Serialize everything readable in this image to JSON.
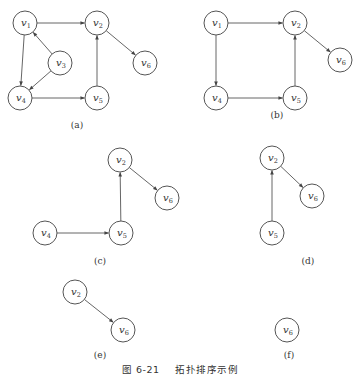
{
  "figure": {
    "caption_number": "图 6-21",
    "caption_title": "拓扑排序示例",
    "node_radius": 12,
    "colors": {
      "stroke": "#555555",
      "text": "#333333",
      "background": "#ffffff"
    },
    "panels": [
      {
        "id": "a",
        "label": "(a)",
        "label_pos": [
          77,
          128
        ],
        "nodes": [
          {
            "id": "v1",
            "name": "v",
            "sub": "1",
            "x": 25,
            "y": 23
          },
          {
            "id": "v2",
            "name": "v",
            "sub": "2",
            "x": 97,
            "y": 23
          },
          {
            "id": "v3",
            "name": "v",
            "sub": "3",
            "x": 60,
            "y": 63
          },
          {
            "id": "v4",
            "name": "v",
            "sub": "4",
            "x": 20,
            "y": 98
          },
          {
            "id": "v5",
            "name": "v",
            "sub": "5",
            "x": 97,
            "y": 98
          },
          {
            "id": "v6",
            "name": "v",
            "sub": "6",
            "x": 145,
            "y": 63
          }
        ],
        "edges": [
          [
            "v1",
            "v2"
          ],
          [
            "v1",
            "v4"
          ],
          [
            "v3",
            "v1"
          ],
          [
            "v3",
            "v4"
          ],
          [
            "v4",
            "v5"
          ],
          [
            "v5",
            "v2"
          ],
          [
            "v2",
            "v6"
          ]
        ]
      },
      {
        "id": "b",
        "label": "(b)",
        "label_pos": [
          277,
          118
        ],
        "nodes": [
          {
            "id": "v1",
            "name": "v",
            "sub": "1",
            "x": 216,
            "y": 23
          },
          {
            "id": "v2",
            "name": "v",
            "sub": "2",
            "x": 295,
            "y": 23
          },
          {
            "id": "v4",
            "name": "v",
            "sub": "4",
            "x": 216,
            "y": 98
          },
          {
            "id": "v5",
            "name": "v",
            "sub": "5",
            "x": 295,
            "y": 98
          },
          {
            "id": "v6",
            "name": "v",
            "sub": "6",
            "x": 340,
            "y": 60
          }
        ],
        "edges": [
          [
            "v1",
            "v2"
          ],
          [
            "v1",
            "v4"
          ],
          [
            "v4",
            "v5"
          ],
          [
            "v5",
            "v2"
          ],
          [
            "v2",
            "v6"
          ]
        ]
      },
      {
        "id": "c",
        "label": "(c)",
        "label_pos": [
          100,
          264
        ],
        "nodes": [
          {
            "id": "v2",
            "name": "v",
            "sub": "2",
            "x": 120,
            "y": 160
          },
          {
            "id": "v6",
            "name": "v",
            "sub": "6",
            "x": 167,
            "y": 198
          },
          {
            "id": "v4",
            "name": "v",
            "sub": "4",
            "x": 45,
            "y": 233
          },
          {
            "id": "v5",
            "name": "v",
            "sub": "5",
            "x": 121,
            "y": 233
          }
        ],
        "edges": [
          [
            "v4",
            "v5"
          ],
          [
            "v5",
            "v2"
          ],
          [
            "v2",
            "v6"
          ]
        ]
      },
      {
        "id": "d",
        "label": "(d)",
        "label_pos": [
          308,
          264
        ],
        "nodes": [
          {
            "id": "v2",
            "name": "v",
            "sub": "2",
            "x": 272,
            "y": 158
          },
          {
            "id": "v6",
            "name": "v",
            "sub": "6",
            "x": 312,
            "y": 196
          },
          {
            "id": "v5",
            "name": "v",
            "sub": "5",
            "x": 272,
            "y": 233
          }
        ],
        "edges": [
          [
            "v5",
            "v2"
          ],
          [
            "v2",
            "v6"
          ]
        ]
      },
      {
        "id": "e",
        "label": "(e)",
        "label_pos": [
          100,
          358
        ],
        "nodes": [
          {
            "id": "v2",
            "name": "v",
            "sub": "2",
            "x": 75,
            "y": 292
          },
          {
            "id": "v6",
            "name": "v",
            "sub": "6",
            "x": 123,
            "y": 330
          }
        ],
        "edges": [
          [
            "v2",
            "v6"
          ]
        ]
      },
      {
        "id": "f",
        "label": "(f)",
        "label_pos": [
          289,
          358
        ],
        "nodes": [
          {
            "id": "v6",
            "name": "v",
            "sub": "6",
            "x": 287,
            "y": 330
          }
        ],
        "edges": []
      }
    ]
  }
}
